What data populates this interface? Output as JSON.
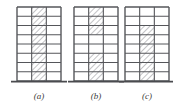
{
  "figure": {
    "type": "structural-elevation-diagram",
    "panel_count": 3,
    "stories": 8,
    "bays": 3,
    "colors": {
      "line": "#55565a",
      "hatch": "#7a7b80",
      "ground": "#4a4b4f",
      "caption": "#3c3c3c",
      "background": "#ffffff"
    },
    "geometry": {
      "frame_top_y": 7,
      "frame_base_y": 81,
      "ground_line_y": 81,
      "story_height": 9.25,
      "frame_width": 44,
      "bay_width": 14.666,
      "panel_origins_x": [
        17,
        74,
        125
      ]
    }
  },
  "panels": [
    {
      "id": "panel-a",
      "caption": "(a)",
      "caption_x": 39,
      "caption_y": 99,
      "origin_x": 17,
      "wall_bay_index": 1,
      "wall_top_story": 0,
      "wall_bottom_story": 8,
      "wall_description": "Shear wall continuous over full height in the middle bay"
    },
    {
      "id": "panel-b",
      "caption": "(b)",
      "caption_x": 96,
      "caption_y": 99,
      "origin_x": 74,
      "wall_bay_index": 1,
      "wall_segments": [
        {
          "top_story": 0,
          "bottom_story": 3
        },
        {
          "top_story": 5,
          "bottom_story": 8
        }
      ],
      "wall_description": "Shear wall at upper three stories and lower three stories with an open gap at mid-height"
    },
    {
      "id": "panel-c",
      "caption": "(c)",
      "caption_x": 147,
      "caption_y": 99,
      "origin_x": 125,
      "wall_bay_index": 1,
      "wall_top_story": 2,
      "wall_bottom_story": 8,
      "wall_description": "Shear wall from mid-height down to the foundation, upper two stories open"
    }
  ]
}
